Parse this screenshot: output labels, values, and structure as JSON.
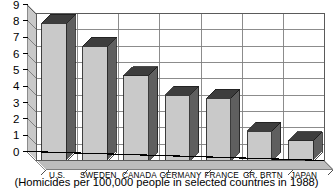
{
  "figure": {
    "caption": "(Homicides per 100,000 people in selected countries in 1988)"
  },
  "chart_data": {
    "type": "bar",
    "title": "",
    "subtitle": "",
    "xlabel": "",
    "ylabel": "",
    "ylim": [
      0,
      9
    ],
    "yticks": [
      0,
      1,
      2,
      3,
      4,
      5,
      6,
      7,
      8,
      9
    ],
    "ytick_labels": [
      "0",
      "1",
      "2",
      "3",
      "4",
      "5",
      "6",
      "7",
      "8",
      "9"
    ],
    "grid": true,
    "grid_axis": "y",
    "legend": false,
    "legend_position": "none",
    "style": "3d-bar",
    "categories": [
      "U.S.",
      "SWEDEN",
      "CANADA",
      "GERMANY",
      "FRANCE",
      "GR. BRTN",
      "JAPAN"
    ],
    "values": [
      8.4,
      7.0,
      5.2,
      4.0,
      3.8,
      1.8,
      1.2
    ],
    "annotations": [
      "(Homicides per 100,000 people in selected countries in 1988)"
    ],
    "colors": {
      "bar_front": "#c9c9c9",
      "bar_top": "#3d3d3d",
      "bar_side": "#5f5f5f",
      "wall": "#c9c9c9",
      "floor": "#bdbdbd",
      "grid": "#808080",
      "axis": "#000000",
      "background": "#ffffff"
    }
  }
}
